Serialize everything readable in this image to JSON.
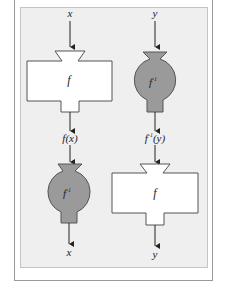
{
  "diagram": {
    "colors": {
      "panel_bg": "#efefef",
      "stroke": "#555555",
      "inverse_fill": "#9a9a9a",
      "function_fill": "#ffffff"
    },
    "columns": [
      {
        "input_label": "x",
        "first_machine": {
          "type": "box",
          "label": "f"
        },
        "middle_label": "f(x)",
        "second_machine": {
          "type": "round-vessel",
          "label": "f",
          "label_sup": "-1"
        },
        "output_label": "x"
      },
      {
        "input_label": "y",
        "first_machine": {
          "type": "round-vessel",
          "label": "f",
          "label_sup": "-1"
        },
        "middle_label_base": "f",
        "middle_label_sup": "-1",
        "middle_label_arg": "(y)",
        "second_machine": {
          "type": "box",
          "label": "f"
        },
        "output_label": "y"
      }
    ]
  }
}
